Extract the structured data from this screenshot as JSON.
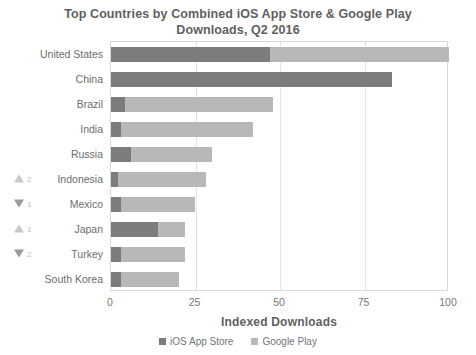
{
  "chart_data": {
    "type": "bar",
    "orientation": "horizontal",
    "stacked": true,
    "title": "Top Countries by Combined iOS App Store & Google Play Downloads, Q2 2016",
    "title_lines": [
      "Top Countries by Combined iOS App Store & Google Play",
      "Downloads, Q2 2016"
    ],
    "xlabel": "Indexed Downloads",
    "ylabel": "",
    "xlim": [
      0,
      100
    ],
    "xticks": [
      0,
      25,
      50,
      75,
      100
    ],
    "xtick_labels": [
      "0",
      "25",
      "50",
      "75",
      "100"
    ],
    "grid": "vertical",
    "legend_position": "bottom",
    "categories": [
      "United States",
      "China",
      "Brazil",
      "India",
      "Russia",
      "Indonesia",
      "Mexico",
      "Japan",
      "Turkey",
      "South Korea"
    ],
    "series": [
      {
        "name": "iOS App Store",
        "color": "#7c7c7c",
        "values": [
          47,
          83,
          4,
          3,
          6,
          2,
          3,
          14,
          3,
          3
        ]
      },
      {
        "name": "Google Play",
        "color": "#b8b8b8",
        "values": [
          53,
          0,
          44,
          39,
          24,
          26,
          22,
          8,
          19,
          17
        ]
      }
    ],
    "totals": [
      100,
      83,
      48,
      42,
      30,
      28,
      25,
      22,
      22,
      20
    ],
    "rank_changes": [
      {
        "category": "United States",
        "direction": "",
        "amount": ""
      },
      {
        "category": "China",
        "direction": "",
        "amount": ""
      },
      {
        "category": "Brazil",
        "direction": "",
        "amount": ""
      },
      {
        "category": "India",
        "direction": "",
        "amount": ""
      },
      {
        "category": "Russia",
        "direction": "",
        "amount": ""
      },
      {
        "category": "Indonesia",
        "direction": "up",
        "amount": "2"
      },
      {
        "category": "Mexico",
        "direction": "down",
        "amount": "1"
      },
      {
        "category": "Japan",
        "direction": "up",
        "amount": "1"
      },
      {
        "category": "Turkey",
        "direction": "down",
        "amount": "2"
      },
      {
        "category": "South Korea",
        "direction": "",
        "amount": ""
      }
    ]
  },
  "legend": {
    "items": [
      {
        "label": "iOS App Store",
        "color": "#7c7c7c"
      },
      {
        "label": "Google Play",
        "color": "#b8b8b8"
      }
    ]
  },
  "colors": {
    "ios_app_store": "#7c7c7c",
    "google_play": "#b8b8b8",
    "gridline": "#e2e2e2",
    "frame": "#d8d8d8",
    "text": "#6b6b6b"
  }
}
